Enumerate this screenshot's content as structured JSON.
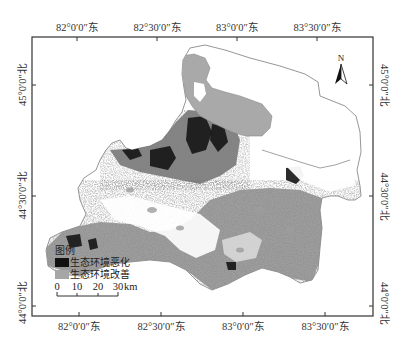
{
  "map": {
    "top_axis_labels": [
      "82°0′0″东",
      "82°30′0″东",
      "83°0′0″东",
      "83°30′0″东"
    ],
    "bottom_axis_labels": [
      "82°0′0″东",
      "82°30′0″东",
      "83°0′0″东",
      "83°30′0″东"
    ],
    "left_axis_labels": [
      "45°0′0″北",
      "44°30′0″北",
      "44°0′0″北"
    ],
    "right_axis_labels": [
      "45°0′0″北",
      "44°30′0″北",
      "44°0′0″北"
    ],
    "north_arrow": {
      "label": "N",
      "icon": "north-arrow-icon"
    },
    "legend": {
      "title": "图例",
      "items": [
        {
          "label": "生态环境恶化",
          "color": "#111111"
        },
        {
          "label": "生态环境改善",
          "color": "#a6a6a6"
        }
      ]
    },
    "scale_bar": {
      "ticks": [
        "0",
        "10",
        "20",
        "30"
      ],
      "unit": "km"
    },
    "colors": {
      "frame": "#333333",
      "lake": "#a9a9a9",
      "degradation": "#151515",
      "improvement": "#9c9c9c",
      "texture": "#6e6e6e",
      "boundary": "#8a8a8a"
    }
  }
}
